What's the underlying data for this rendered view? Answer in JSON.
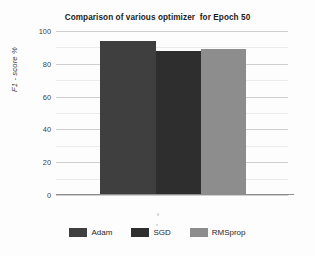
{
  "chart_data": {
    "type": "bar",
    "title": "Comparison of various optimizer  for Epoch 50",
    "xlabel": "",
    "ylabel": "F1 - score %",
    "categories": [
      "Adam",
      "SGD",
      "RMSprop"
    ],
    "values": [
      94,
      88,
      89
    ],
    "series": [
      {
        "name": "F1 - score %",
        "values": [
          94,
          88,
          89
        ]
      }
    ],
    "ylim": [
      0,
      100
    ],
    "yticks": [
      0,
      20,
      40,
      60,
      80,
      100
    ],
    "ytick_labels": [
      "0",
      "20",
      "40",
      "60",
      "80",
      "100"
    ],
    "minor_tick_step": 10,
    "grid": true,
    "grid_axis": "y",
    "legend_position": "bottom",
    "bar_colors": [
      "#3f3f3f",
      "#2e2e2e",
      "#8d8d8d"
    ],
    "background_color": "#fdfdfd",
    "axis_color": "#8e8e8e",
    "gridline_color": "#d9d9d9"
  },
  "legend": {
    "items": [
      {
        "label": "Adam",
        "color": "#3f3f3f"
      },
      {
        "label": "SGD",
        "color": "#2e2e2e"
      },
      {
        "label": "RMSprop",
        "color": "#8d8d8d"
      }
    ]
  }
}
